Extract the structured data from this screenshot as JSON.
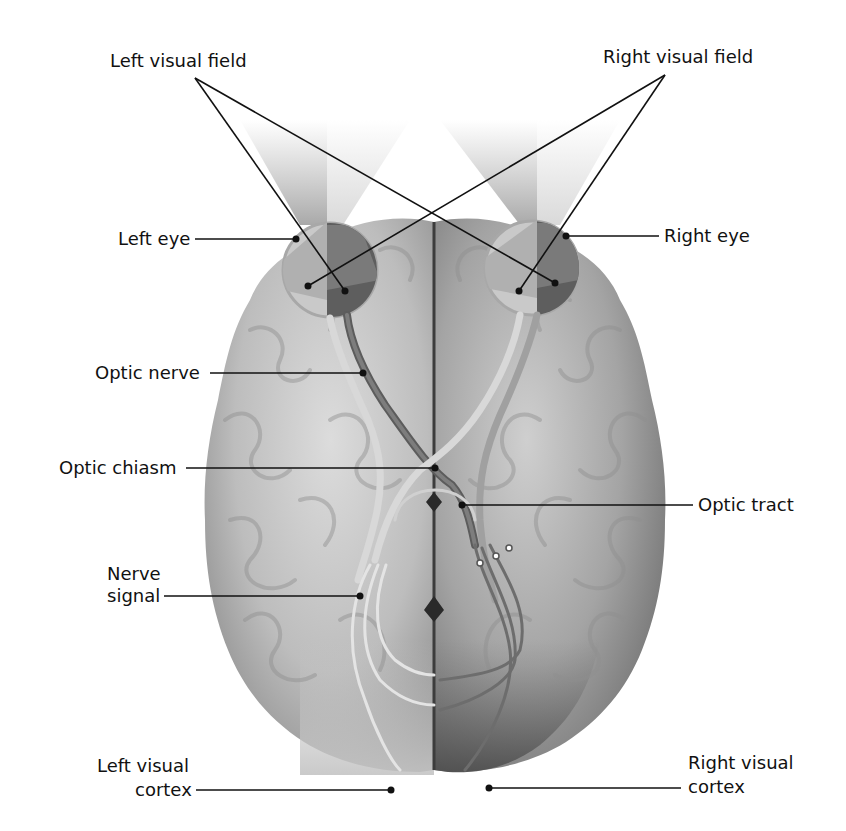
{
  "figure": {
    "colors": {
      "background": "#ffffff",
      "brain_light": "#cfcfcf",
      "brain_mid": "#a9a9a9",
      "brain_dark": "#6e6e6e",
      "right_hemisphere_cortex": "#5a5a5a",
      "nerve_dark": "#5e5e5e",
      "nerve_light": "#d8d8d8",
      "leader_line": "#111111"
    },
    "labels": {
      "left_visual_field": "Left visual field",
      "right_visual_field": "Right visual field",
      "left_eye": "Left eye",
      "right_eye": "Right eye",
      "optic_nerve": "Optic nerve",
      "optic_chiasm": "Optic chiasm",
      "optic_tract": "Optic tract",
      "nerve_signal_line1": "Nerve",
      "nerve_signal_line2": "signal",
      "left_visual_cortex_line1": "Left visual",
      "left_visual_cortex_line2": "cortex",
      "right_visual_cortex_line1": "Right visual",
      "right_visual_cortex_line2": "cortex"
    }
  }
}
